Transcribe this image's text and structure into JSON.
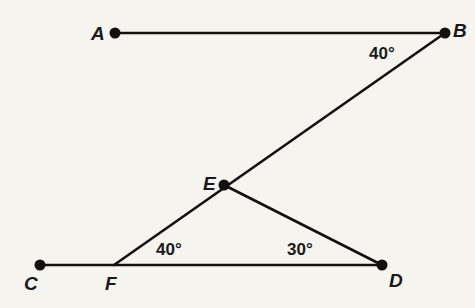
{
  "diagram": {
    "background": "#f6f4ee",
    "stroke_color": "#111111",
    "points": {
      "A": {
        "label": "A",
        "x": 115,
        "y": 33
      },
      "B": {
        "label": "B",
        "x": 445,
        "y": 33
      },
      "C": {
        "label": "C",
        "x": 40,
        "y": 265
      },
      "D": {
        "label": "D",
        "x": 382,
        "y": 265
      },
      "E": {
        "label": "E",
        "x": 224,
        "y": 185
      },
      "F": {
        "label": "F",
        "x": 114,
        "y": 265
      }
    },
    "segments": [
      "AB",
      "BF",
      "CD",
      "ED"
    ],
    "angles": {
      "ABE": {
        "label": "40°",
        "vertex": "B"
      },
      "EFD": {
        "label": "40°",
        "vertex": "F"
      },
      "EDF": {
        "label": "30°",
        "vertex": "D"
      }
    }
  }
}
